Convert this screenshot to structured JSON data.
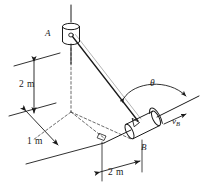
{
  "figure": {
    "type": "engineering-mechanics-diagram",
    "stroke_color": "#1a1a1a",
    "background_color": "#ffffff"
  },
  "labels": {
    "point_a": "A",
    "point_b": "B",
    "vertical_dimension": "2 m",
    "depth_dimension": "1 m",
    "horizontal_dimension": "2 m",
    "angle": "θ",
    "velocity_symbol": "v",
    "velocity_subscript": "B"
  },
  "geometry": {
    "collar_a": {
      "label": "A",
      "shape": "cylinder",
      "axis": "vertical",
      "cx": 71,
      "cy": 33
    },
    "collar_b": {
      "label": "B",
      "shape": "cylinder",
      "axis": "inclined",
      "cx": 143,
      "cy": 124
    },
    "rod_a": {
      "description": "vertical-guide-rod",
      "x": 71,
      "y1": 5,
      "y2": 62
    },
    "rod_b": {
      "description": "inclined-guide-rod",
      "x1": 104,
      "y1": 143,
      "x2": 199,
      "y2": 96
    },
    "connecting_bar": {
      "from": "A",
      "to": "B"
    },
    "right_angle_marker": {
      "x": 103,
      "y": 136
    }
  },
  "dimensions": [
    {
      "name": "vertical",
      "value": "2 m",
      "direction": "vertical",
      "between": [
        "ground-plane",
        "collar-A-level"
      ]
    },
    {
      "name": "depth",
      "value": "1 m",
      "direction": "diagonal-depth",
      "between": [
        "left-edge",
        "origin"
      ]
    },
    {
      "name": "horizontal",
      "value": "2 m",
      "direction": "diagonal-horizontal",
      "between": [
        "origin-projection",
        "collar-B"
      ]
    }
  ]
}
